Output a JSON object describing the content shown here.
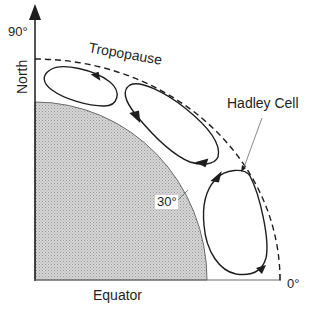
{
  "diagram": {
    "labels": {
      "north_angle": "90°",
      "north": "North",
      "tropopause": "Tropopause",
      "hadley_cell": "Hadley Cell",
      "latitude_30": "30°",
      "equator_angle": "0°",
      "equator": "Equator"
    },
    "cells": [
      {
        "name": "Polar cell",
        "direction": "counterclockwise-top arrow left"
      },
      {
        "name": "Ferrel cell",
        "direction": "clockwise"
      },
      {
        "name": "Hadley cell",
        "direction": "counterclockwise"
      }
    ],
    "colors": {
      "line": "#1e1e1e",
      "earth_fill": "#c8c8c8",
      "background": "#ffffff"
    }
  }
}
